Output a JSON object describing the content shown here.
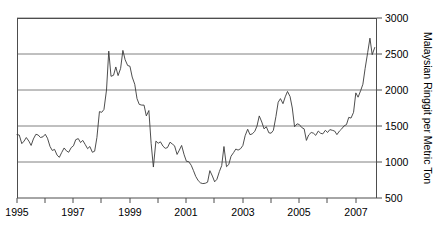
{
  "chart_data": {
    "type": "line",
    "title": "",
    "subtitle": "",
    "xlabel": "",
    "ylabel": "Malaysian Ringgit per Metric Ton",
    "xlim": [
      1995.0,
      2007.75
    ],
    "ylim": [
      500,
      3000
    ],
    "grid": true,
    "grid_axis": "y",
    "legend": "none",
    "y_ticks": [
      500,
      1000,
      1500,
      2000,
      2500,
      3000
    ],
    "y_tick_labels": [
      "500",
      "1000",
      "1500",
      "2000",
      "2500",
      "3000"
    ],
    "y_axis_position": "right",
    "x_ticks": [
      1995,
      1996,
      1997,
      1998,
      1999,
      2000,
      2001,
      2002,
      2003,
      2004,
      2005,
      2006,
      2007
    ],
    "x_tick_labels_shown": [
      "1995",
      "1997",
      "1999",
      "2001",
      "2003",
      "2005",
      "2007"
    ],
    "x_tick_labels_shown_at": [
      1995,
      1997,
      1999,
      2001,
      2003,
      2005,
      2007
    ],
    "series": [
      {
        "name": "Palm oil price",
        "color": "#3a3a3a",
        "x": [
          1995.0,
          1995.08,
          1995.17,
          1995.25,
          1995.33,
          1995.42,
          1995.5,
          1995.58,
          1995.67,
          1995.75,
          1995.83,
          1995.92,
          1996.0,
          1996.08,
          1996.17,
          1996.25,
          1996.33,
          1996.42,
          1996.5,
          1996.58,
          1996.67,
          1996.75,
          1996.83,
          1996.92,
          1997.0,
          1997.08,
          1997.17,
          1997.25,
          1997.33,
          1997.42,
          1997.5,
          1997.58,
          1997.67,
          1997.75,
          1997.83,
          1997.92,
          1998.0,
          1998.08,
          1998.17,
          1998.25,
          1998.33,
          1998.42,
          1998.5,
          1998.58,
          1998.67,
          1998.75,
          1998.83,
          1998.92,
          1999.0,
          1999.08,
          1999.17,
          1999.25,
          1999.33,
          1999.42,
          1999.5,
          1999.58,
          1999.67,
          1999.75,
          1999.83,
          1999.92,
          2000.0,
          2000.08,
          2000.17,
          2000.25,
          2000.33,
          2000.42,
          2000.5,
          2000.58,
          2000.67,
          2000.75,
          2000.83,
          2000.92,
          2001.0,
          2001.08,
          2001.17,
          2001.25,
          2001.33,
          2001.42,
          2001.5,
          2001.58,
          2001.67,
          2001.75,
          2001.83,
          2001.92,
          2002.0,
          2002.08,
          2002.17,
          2002.25,
          2002.33,
          2002.42,
          2002.5,
          2002.58,
          2002.67,
          2002.75,
          2002.83,
          2002.92,
          2003.0,
          2003.08,
          2003.17,
          2003.25,
          2003.33,
          2003.42,
          2003.5,
          2003.58,
          2003.67,
          2003.75,
          2003.83,
          2003.92,
          2004.0,
          2004.08,
          2004.17,
          2004.25,
          2004.33,
          2004.42,
          2004.5,
          2004.58,
          2004.67,
          2004.75,
          2004.83,
          2004.92,
          2005.0,
          2005.08,
          2005.17,
          2005.25,
          2005.33,
          2005.42,
          2005.5,
          2005.58,
          2005.67,
          2005.75,
          2005.83,
          2005.92,
          2006.0,
          2006.08,
          2006.17,
          2006.25,
          2006.33,
          2006.42,
          2006.5,
          2006.58,
          2006.67,
          2006.75,
          2006.83,
          2006.92,
          2007.0,
          2007.08,
          2007.17,
          2007.25,
          2007.33,
          2007.42,
          2007.5,
          2007.58,
          2007.67
        ],
        "values": [
          1380,
          1375,
          1255,
          1290,
          1340,
          1290,
          1230,
          1320,
          1385,
          1375,
          1340,
          1350,
          1385,
          1330,
          1215,
          1160,
          1175,
          1095,
          1065,
          1130,
          1195,
          1155,
          1135,
          1200,
          1225,
          1310,
          1325,
          1270,
          1300,
          1240,
          1185,
          1215,
          1135,
          1150,
          1340,
          1700,
          1690,
          1730,
          2000,
          2540,
          2190,
          2205,
          2320,
          2200,
          2300,
          2550,
          2420,
          2340,
          2330,
          2180,
          2080,
          1880,
          1800,
          1790,
          1790,
          1640,
          1715,
          1260,
          930,
          1290,
          1260,
          1280,
          1220,
          1190,
          1200,
          1275,
          1250,
          1225,
          1105,
          1165,
          1230,
          1100,
          1010,
          1005,
          955,
          880,
          800,
          740,
          710,
          700,
          705,
          720,
          880,
          805,
          725,
          760,
          870,
          950,
          1215,
          935,
          965,
          1080,
          1130,
          1180,
          1165,
          1185,
          1230,
          1365,
          1455,
          1380,
          1390,
          1425,
          1500,
          1640,
          1555,
          1460,
          1490,
          1405,
          1400,
          1440,
          1630,
          1830,
          1880,
          1810,
          1905,
          1980,
          1910,
          1750,
          1490,
          1530,
          1520,
          1480,
          1460,
          1300,
          1375,
          1410,
          1400,
          1370,
          1430,
          1400,
          1390,
          1440,
          1410,
          1450,
          1440,
          1430,
          1380,
          1430,
          1460,
          1500,
          1520,
          1620,
          1610,
          1690,
          1960,
          1900,
          1990,
          2080,
          2300,
          2520,
          2720,
          2490,
          2590
        ]
      }
    ],
    "annotations": [],
    "notable_points": {
      "peak_1998": 2550,
      "trough_2001": 700,
      "peak_2004": 1980,
      "peak_2007": 2720
    }
  },
  "axis": {
    "y_title": "Malaysian Ringgit per Metric Ton",
    "y_labels": [
      "3000",
      "2500",
      "2000",
      "1500",
      "1000",
      "500"
    ],
    "x_labels": [
      "1995",
      "1997",
      "1999",
      "2001",
      "2003",
      "2005",
      "2007"
    ]
  },
  "colors": {
    "line": "#3a3a3a",
    "grid": "#808080",
    "frame": "#4d4d4d",
    "text": "#000000",
    "background": "#ffffff"
  }
}
